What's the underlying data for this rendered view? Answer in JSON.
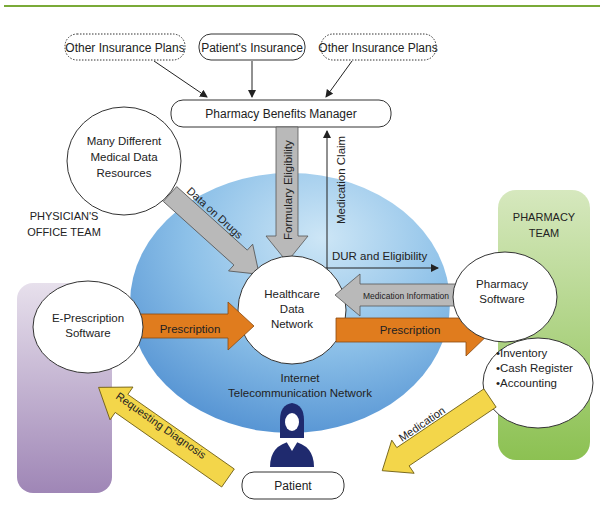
{
  "header": {
    "rule_color": "#7aaa38"
  },
  "insurance": {
    "left": "Other Insurance Plans",
    "center": "Patient's Insurance",
    "right": "Other Insurance Plans"
  },
  "pbm": "Pharmacy Benefits Manager",
  "resources": {
    "line1": "Many Different",
    "line2": "Medical Data",
    "line3": "Resources"
  },
  "physician_team": {
    "line1": "PHYSICIAN'S",
    "line2": "OFFICE TEAM"
  },
  "pharmacy_team": {
    "line1": "PHARMACY",
    "line2": "TEAM"
  },
  "network": {
    "hub_line1": "Healthcare",
    "hub_line2": "Data",
    "hub_line3": "Network",
    "caption_line1": "Internet",
    "caption_line2": "Telecommunication Network"
  },
  "eprescription": {
    "line1": "E-Prescription",
    "line2": "Software"
  },
  "pharmacy_software": {
    "line1": "Pharmacy",
    "line2": "Software"
  },
  "pharmacy_functions": [
    "•Inventory",
    "•Cash Register",
    "•Accounting"
  ],
  "patient": "Patient",
  "arrows": {
    "data_on_drugs": "Data on Drugs",
    "formulary_eligibility": "Formulary Eligibility",
    "medication_claim": "Medication Claim",
    "dur_eligibility": "DUR and Eligibility",
    "medication_information": "Medication Information",
    "prescription_left": "Prescription",
    "prescription_right": "Prescription",
    "requesting_diagnosis": "Requesting Diagnosis",
    "medication": "Medication"
  },
  "colors": {
    "physician_panel": "#b8a4c8",
    "pharmacy_panel": "#a9cf78",
    "network_blue": "#6fa7d8",
    "orange_arrow": "#e07c1e",
    "yellow_arrow": "#f3d64a",
    "gray_arrow": "#b9b9b9",
    "patient_icon": "#1f2a6e"
  }
}
